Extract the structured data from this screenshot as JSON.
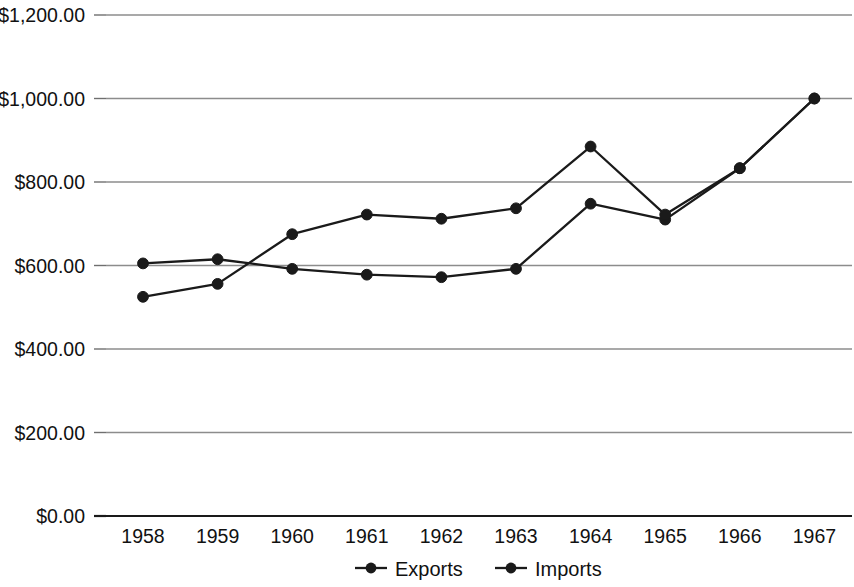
{
  "chart_data": {
    "type": "line",
    "title": "",
    "xlabel": "",
    "ylabel": "",
    "categories": [
      "1958",
      "1959",
      "1960",
      "1961",
      "1962",
      "1963",
      "1964",
      "1965",
      "1966",
      "1967"
    ],
    "series": [
      {
        "name": "Exports",
        "values": [
          605,
          615,
          592,
          578,
          572,
          592,
          748,
          710,
          833,
          1000
        ]
      },
      {
        "name": "Imports",
        "values": [
          525,
          556,
          675,
          722,
          712,
          737,
          885,
          722,
          833,
          1000
        ]
      }
    ],
    "ylim": [
      0,
      1200
    ],
    "ytick_values": [
      0,
      200,
      400,
      600,
      800,
      1000,
      1200
    ],
    "ytick_labels": [
      "$0.00",
      "$200.00",
      "$400.00",
      "$600.00",
      "$800.00",
      "$1,000.00",
      "$1,200.00"
    ],
    "grid": true,
    "legend_position": "bottom",
    "legend_entries": [
      "Exports",
      "Imports"
    ],
    "colors": {
      "series_exports": "#1a1a1a",
      "series_imports": "#1a1a1a",
      "gridline": "#8c8c8c",
      "axis": "#1a1a1a",
      "background": "#ffffff",
      "text": "#111111"
    }
  }
}
